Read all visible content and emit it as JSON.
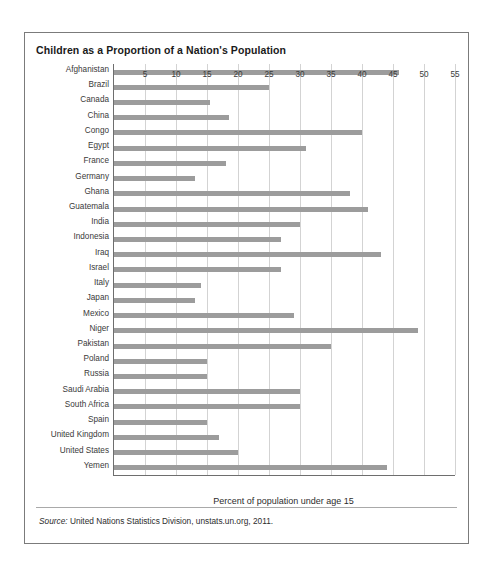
{
  "figure": {
    "title": "Children as a Proportion of a Nation's Population",
    "source_prefix": "Source:",
    "source_text": " United Nations Statistics Division, unstats.un.org, 2011.",
    "bar_color": "#9c9c9c",
    "grid_color": "#d3d3d3",
    "axis_color": "#6e6e6e",
    "border_color": "#7b7b7b"
  },
  "chart_data": {
    "type": "bar",
    "orientation": "horizontal",
    "title": "Children as a Proportion of a Nation's Population",
    "xlabel": "Percent of population under age 15",
    "ylabel": "",
    "xlim": [
      0,
      55
    ],
    "xticks": [
      5,
      10,
      15,
      20,
      25,
      30,
      35,
      40,
      45,
      50,
      55
    ],
    "grid": "vertical",
    "legend": "none",
    "categories": [
      "Afghanistan",
      "Brazil",
      "Canada",
      "China",
      "Congo",
      "Egypt",
      "France",
      "Germany",
      "Ghana",
      "Guatemala",
      "India",
      "Indonesia",
      "Iraq",
      "Israel",
      "Italy",
      "Japan",
      "Mexico",
      "Niger",
      "Pakistan",
      "Poland",
      "Russia",
      "Saudi Arabia",
      "South Africa",
      "Spain",
      "United Kingdom",
      "United States",
      "Yemen"
    ],
    "values": [
      46,
      25,
      15.5,
      18.5,
      40,
      31,
      18,
      13,
      38,
      41,
      30,
      27,
      43,
      27,
      14,
      13,
      29,
      49,
      35,
      15,
      15,
      30,
      30,
      15,
      17,
      20,
      44
    ]
  }
}
